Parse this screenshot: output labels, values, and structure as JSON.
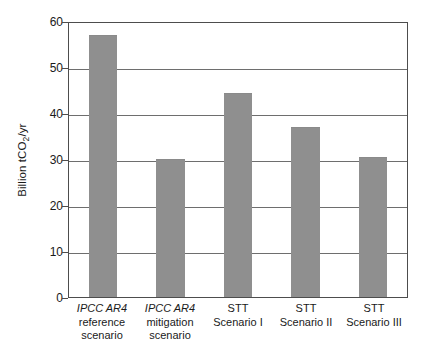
{
  "chart_data": {
    "type": "bar",
    "title": "",
    "subtitle": "",
    "xlabel": "",
    "ylabel": "Billion tCO2/yr",
    "ylabel_parts": {
      "pre": "Billion tCO",
      "sub": "2",
      "post": "/yr"
    },
    "ylim": [
      0,
      60
    ],
    "yticks": [
      0,
      10,
      20,
      30,
      40,
      50,
      60
    ],
    "ytick_labels": [
      "0",
      "10",
      "20",
      "30",
      "40",
      "50",
      "60"
    ],
    "grid": true,
    "grid_axis": "y",
    "legend": false,
    "legend_position": "none",
    "bar_color": "#8f8f8f",
    "axis_color": "#4d4d4d",
    "gridline_color": "#6e6e6e",
    "background_color": "#ffffff",
    "categories": [
      "IPCC AR4 reference scenario",
      "IPCC AR4 mitigation scenario",
      "STT Scenario I",
      "STT Scenario II",
      "STT Scenario III"
    ],
    "category_lines": [
      {
        "l1": "IPCC AR4",
        "l2": "reference",
        "l3": "scenario",
        "italic_first_line": true
      },
      {
        "l1": "IPCC AR4",
        "l2": "mitigation",
        "l3": "scenario",
        "italic_first_line": true
      },
      {
        "l1": "STT",
        "l2": "Scenario I",
        "l3": "",
        "italic_first_line": false
      },
      {
        "l1": "STT",
        "l2": "Scenario II",
        "l3": "",
        "italic_first_line": false
      },
      {
        "l1": "STT",
        "l2": "Scenario III",
        "l3": "",
        "italic_first_line": false
      }
    ],
    "values": [
      57.0,
      30.0,
      44.3,
      36.9,
      30.4
    ],
    "annotations": []
  }
}
